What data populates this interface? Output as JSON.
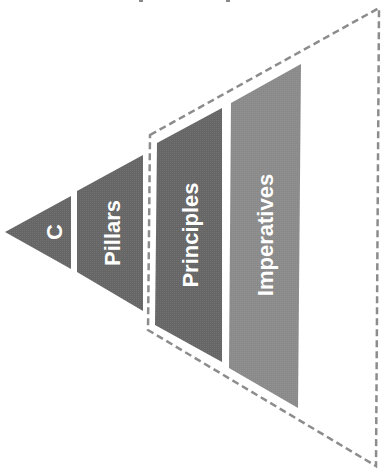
{
  "diagram": {
    "type": "pyramid-rotated",
    "orientation": "apex-left",
    "colors": {
      "dark_fill": "#666666",
      "light_fill": "#8a8a8a",
      "dashed_border": "#8c8c8c",
      "text": "#ffffff",
      "background": "#ffffff"
    },
    "tiers": [
      {
        "id": "c",
        "label": "C"
      },
      {
        "id": "pillars",
        "label": "Pillars"
      },
      {
        "id": "principles",
        "label": "Principles"
      },
      {
        "id": "imperatives",
        "label": "Imperatives"
      }
    ],
    "dashed_region": {
      "encloses": [
        "principles",
        "imperatives"
      ]
    }
  }
}
